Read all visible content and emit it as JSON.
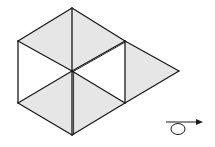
{
  "diagram": {
    "colors": {
      "stroke": "#1a1a1a",
      "shade": "#e6e6e6",
      "background": "#ffffff"
    },
    "faces": [
      {
        "name": "top-rhombus-left-half",
        "shaded": true
      },
      {
        "name": "top-rhombus-right-half",
        "shaded": true
      },
      {
        "name": "left-square",
        "shaded": false
      },
      {
        "name": "middle-square",
        "shaded": false
      },
      {
        "name": "bottom-left-triangle",
        "shaded": true
      },
      {
        "name": "bottom-right-triangle",
        "shaded": true
      },
      {
        "name": "right-triangle",
        "shaded": true
      }
    ],
    "symbol": {
      "name": "rotation-arrow",
      "direction": "right"
    }
  }
}
